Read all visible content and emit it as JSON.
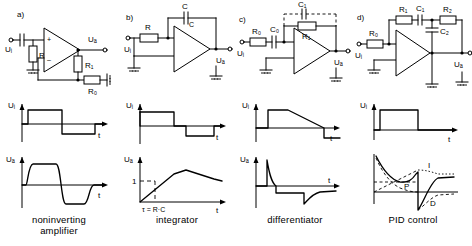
{
  "figure": {
    "type": "op-amp circuit reference figure",
    "columns": [
      {
        "key": "a",
        "panel_letter": "a)",
        "caption_line1": "noninverting",
        "caption_line2": "amplifier",
        "circuit": {
          "input_label": "Uᵢ",
          "output_label": "Uₐ",
          "components": [
            "C",
            "R₂",
            "R₁",
            "R₀"
          ],
          "labels": {
            "r2": "R₂",
            "r1": "R₁",
            "r0": "R₀"
          },
          "opamp_plus": "+",
          "opamp_minus": "–"
        },
        "wave_in": {
          "y_label": "Uᵢ",
          "x_label": "t"
        },
        "wave_out": {
          "y_label": "Uₐ",
          "x_label": "t"
        }
      },
      {
        "key": "b",
        "panel_letter": "b)",
        "caption_line1": "integrator",
        "caption_line2": "",
        "circuit": {
          "input_label": "Uᵢ",
          "output_label": "Uₐ",
          "components": [
            "R",
            "C"
          ],
          "labels": {
            "r": "R",
            "c_top": "C",
            "c_side": "C"
          }
        },
        "wave_in": {
          "y_label": "Uᵢ",
          "x_label": "t"
        },
        "wave_out": {
          "y_label": "Uₐ",
          "x_label": "t",
          "y_tick": "1",
          "tau_label": "τ = R·C"
        }
      },
      {
        "key": "c",
        "panel_letter": "c)",
        "caption_line1": "differentiator",
        "caption_line2": "",
        "circuit": {
          "input_label": "Uᵢ",
          "output_label": "Uₐ",
          "components": [
            "R₀",
            "C₀",
            "R₁",
            "C₁"
          ],
          "labels": {
            "r0": "R₀",
            "c0": "C₀",
            "r1": "R₁",
            "c1": "C₁"
          },
          "c1_optional": true
        },
        "wave_in": {
          "y_label": "Uᵢ",
          "x_label": "t"
        },
        "wave_out": {
          "y_label": "Uₐ",
          "x_label": "t"
        }
      },
      {
        "key": "d",
        "panel_letter": "d)",
        "caption_line1": "PID  control",
        "caption_line2": "",
        "circuit": {
          "input_label": "Uᵢ",
          "output_label": "Uₐ",
          "components": [
            "R₀",
            "R₁",
            "C₁",
            "R₂",
            "C₂"
          ],
          "labels": {
            "r0": "R₀",
            "r1": "R₁",
            "c1": "C₁",
            "r2": "R₂",
            "c2": "C₂"
          }
        },
        "wave_in": {
          "y_label": "Uᵢ",
          "x_label": "t"
        },
        "wave_out": {
          "y_label": "",
          "x_label": "",
          "curve_labels": {
            "integral": "I",
            "proportional": "P",
            "derivative": "D"
          }
        }
      }
    ]
  }
}
